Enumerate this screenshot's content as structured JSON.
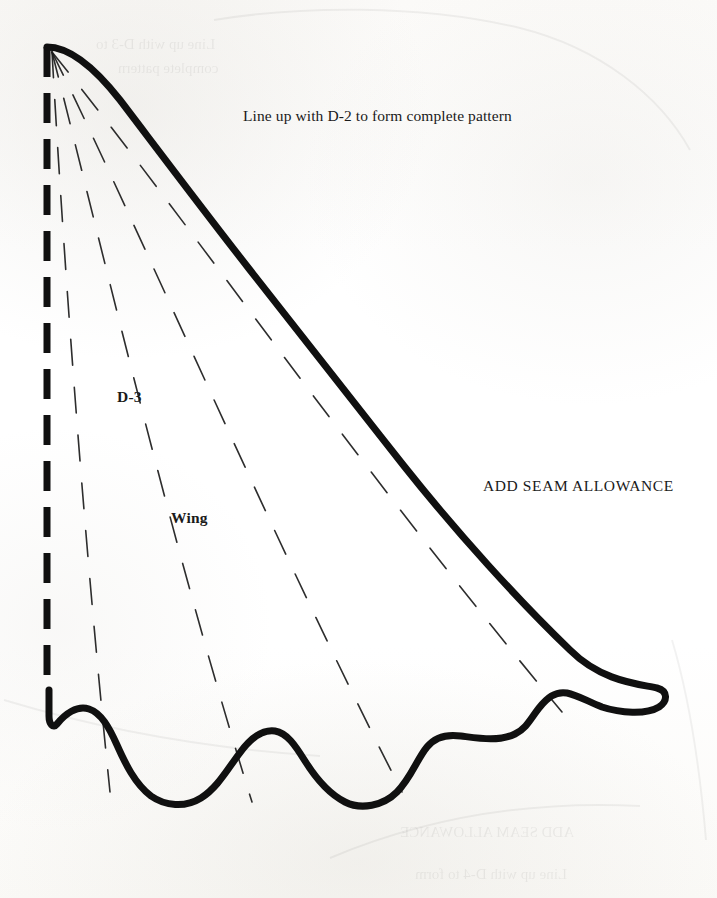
{
  "document": {
    "kind": "sewing-pattern-piece",
    "background_color": "#fdfdfc",
    "ink_color": "#101010"
  },
  "labels": {
    "alignment_note": "Line up with D-2 to form complete pattern",
    "piece_code": "D-3",
    "piece_name": "Wing",
    "seam_note": "ADD SEAM ALLOWANCE"
  },
  "bleed_through": {
    "line_1": "Line up with D-3 to",
    "line_2": "complete pattern",
    "line_3": "ADD SEAM ALLOWANCE",
    "line_4": "Line up with D-4 to form"
  },
  "geometry": {
    "fold_line": {
      "name": "fold-edge",
      "style": "dashed",
      "x": 47,
      "y_start": 47,
      "y_end": 690,
      "stroke_width": 7,
      "dash": "30 16"
    },
    "cut_line": {
      "name": "wing-outline",
      "style": "solid",
      "stroke_width": 7,
      "path": "M 47 47 C 70 47 96 70 118 98 C 150 140 200 205 250 268 C 300 331 352 398 404 464 C 456 530 520 600 568 648 C 600 680 640 684 658 688 C 668 690 668 700 660 706 C 648 714 622 712 604 706 C 588 700 578 694 568 692 C 556 690 548 696 540 706 C 532 716 528 726 516 732 C 500 740 478 736 462 734 C 448 732 436 734 428 744 C 418 756 412 776 398 790 C 384 804 362 808 346 800 C 328 792 316 776 306 760 C 296 744 288 732 276 730 C 262 728 250 738 240 752 C 228 768 218 786 202 796 C 186 806 166 804 152 794 C 136 782 126 762 118 744 C 110 726 102 712 90 708 C 78 704 66 712 58 722 C 54 727 50 722 50 714 L 50 690"
    },
    "dart_lines": {
      "name": "feather-fan-lines",
      "style": "dashed-thin",
      "count": 4,
      "stroke_width": 1.6,
      "dash": "26 22",
      "origin": {
        "x": 52,
        "y": 52
      },
      "endpoints": [
        {
          "x": 110,
          "y": 790
        },
        {
          "x": 250,
          "y": 800
        },
        {
          "x": 400,
          "y": 790
        },
        {
          "x": 560,
          "y": 710
        }
      ]
    }
  }
}
